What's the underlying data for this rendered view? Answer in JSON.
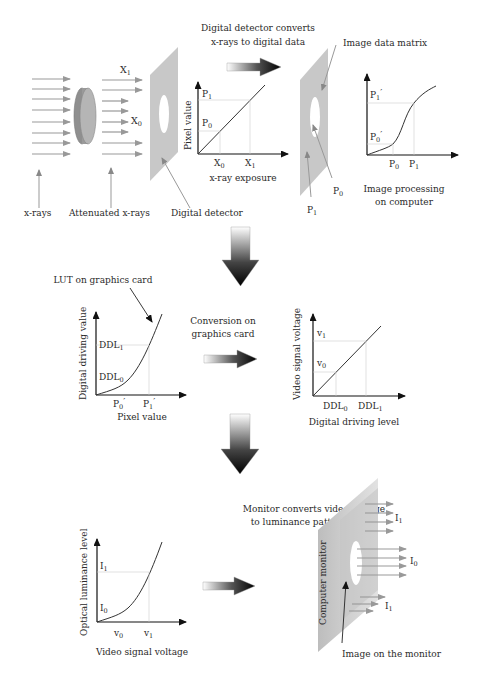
{
  "colors": {
    "ray": "#999999",
    "panel": "#c8c8c8",
    "ink": "#222222",
    "guide": "#cccccc"
  },
  "stage1": {
    "labels": {
      "xrays": "x-rays",
      "attenuated": "Attenuated x-rays",
      "detector": "Digital detector",
      "x1": "X",
      "x1_sub": "1",
      "x0": "X",
      "x0_sub": "0"
    },
    "caption_line1": "Digital detector converts",
    "caption_line2": "x-rays to digital data",
    "chart": {
      "ylabel": "Pixel value",
      "xlabel": "x-ray exposure",
      "y_ticks": [
        {
          "t": "P",
          "s": "1"
        },
        {
          "t": "P",
          "s": "0"
        }
      ],
      "x_ticks": [
        {
          "t": "X",
          "s": "0"
        },
        {
          "t": "X",
          "s": "1"
        }
      ]
    },
    "matrix": {
      "title": "Image data matrix",
      "p0": "P",
      "p0_sub": "0",
      "p1": "P",
      "p1_sub": "1"
    },
    "processing_chart": {
      "y_ticks": [
        {
          "t": "P",
          "s": "1",
          "prime": "′"
        },
        {
          "t": "P",
          "s": "0",
          "prime": "′"
        }
      ],
      "x_ticks": [
        {
          "t": "P",
          "s": "0"
        },
        {
          "t": "P",
          "s": "1"
        }
      ],
      "caption_line1": "Image processing",
      "caption_line2": "on computer"
    }
  },
  "stage2": {
    "lut_label": "LUT on graphics card",
    "chart_left": {
      "ylabel": "Digital driving value",
      "xlabel": "Pixel value",
      "y_ticks": [
        {
          "t": "DDL",
          "s": "1"
        },
        {
          "t": "DDL",
          "s": "0"
        }
      ],
      "x_ticks": [
        {
          "t": "P",
          "s": "0",
          "prime": "′"
        },
        {
          "t": "P",
          "s": "1",
          "prime": "′"
        }
      ]
    },
    "conversion_line1": "Conversion on",
    "conversion_line2": "graphics card",
    "chart_right": {
      "ylabel": "Video signal voltage",
      "xlabel": "Digital driving level",
      "y_ticks": [
        {
          "t": "v",
          "s": "1"
        },
        {
          "t": "v",
          "s": "0"
        }
      ],
      "x_ticks": [
        {
          "t": "DDL",
          "s": "0"
        },
        {
          "t": "DDL",
          "s": "1"
        }
      ]
    }
  },
  "stage3": {
    "caption_line1": "Monitor converts video voltage",
    "caption_line2": "to luminance pattern image",
    "chart": {
      "ylabel": "Optical luminance level",
      "xlabel": "Video signal voltage",
      "y_ticks": [
        {
          "t": "I",
          "s": "1"
        },
        {
          "t": "I",
          "s": "0"
        }
      ],
      "x_ticks": [
        {
          "t": "v",
          "s": "0"
        },
        {
          "t": "v",
          "s": "1"
        }
      ]
    },
    "monitor": {
      "label": "Computer monitor",
      "image_label": "Image on the monitor",
      "i1": "I",
      "i1_sub": "1",
      "i0": "I",
      "i0_sub": "0"
    }
  }
}
